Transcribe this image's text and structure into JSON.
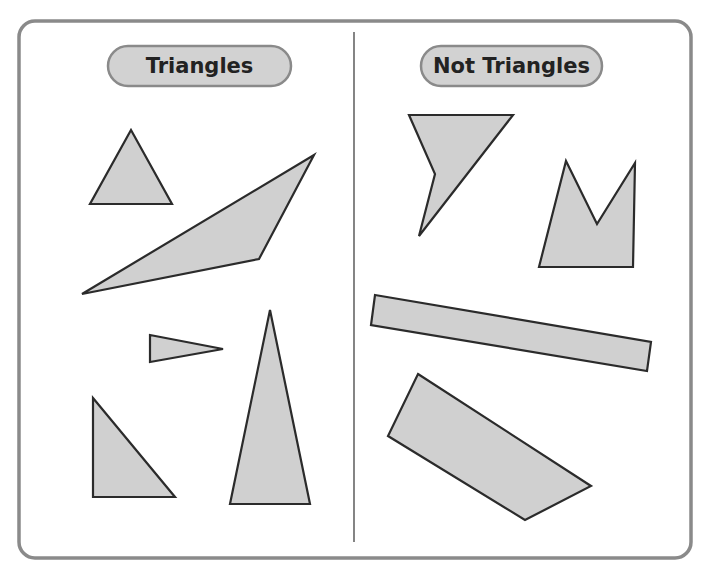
{
  "panels": {
    "left": {
      "label": "Triangles",
      "shapes": [
        {
          "name": "equilateral-triangle",
          "points": "131,130 172,204 90,204"
        },
        {
          "name": "obtuse-scalene-triangle",
          "points": "82,294 314,155 259,259"
        },
        {
          "name": "thin-acute-triangle",
          "points": "150,335 223,349 150,362"
        },
        {
          "name": "right-triangle",
          "points": "93,398 175,497 93,497"
        },
        {
          "name": "tall-isosceles-triangle",
          "points": "270,310 310,504 230,504"
        }
      ]
    },
    "right": {
      "label": "Not Triangles",
      "shapes": [
        {
          "name": "concave-quadrilateral",
          "points": "409,115 513,115 419,236 435,174"
        },
        {
          "name": "notched-pentagon",
          "points": "566,161 597,224 635,163 633,267 539,267"
        },
        {
          "name": "long-rectangle",
          "points": "375,295 651,342 647,371 371,325"
        },
        {
          "name": "trapezoid-quadrilateral",
          "points": "418,374 591,486 525,520 388,436"
        }
      ]
    }
  },
  "colors": {
    "shape_fill": "#d0d0d0",
    "shape_stroke": "#2b2b2b",
    "frame_stroke": "#8a8a8a",
    "pill_fill": "#d2d2d2"
  }
}
